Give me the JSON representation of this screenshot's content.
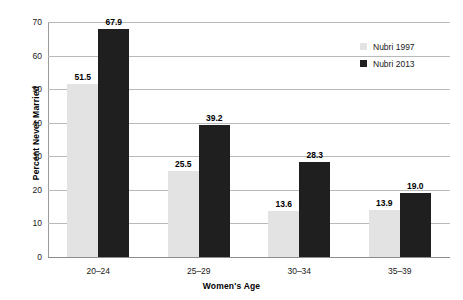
{
  "chart_data": {
    "type": "bar",
    "title": "",
    "xlabel": "Women's Age",
    "ylabel": "Percent Never Married",
    "categories": [
      "20–24",
      "25–29",
      "30–34",
      "35–39"
    ],
    "series": [
      {
        "name": "Nubri 1997",
        "color": "#e3e3e3",
        "values": [
          51.5,
          25.5,
          13.6,
          13.9
        ]
      },
      {
        "name": "Nubri 2013",
        "color": "#1f1f1f",
        "values": [
          67.9,
          39.2,
          28.3,
          19.0
        ]
      }
    ],
    "value_labels": [
      [
        "51.5",
        "25.5",
        "13.6",
        "13.9"
      ],
      [
        "67.9",
        "39.2",
        "28.3",
        "19.0"
      ]
    ],
    "ylim": [
      0,
      70
    ],
    "yticks": [
      0,
      10,
      20,
      30,
      40,
      50,
      60,
      70
    ],
    "ytick_labels": [
      "0",
      "10",
      "20",
      "30",
      "40",
      "50",
      "60",
      "70"
    ],
    "grid": true,
    "legend_position": "top-right"
  },
  "legend": {
    "items": [
      {
        "label": "Nubri 1997",
        "color": "#e3e3e3"
      },
      {
        "label": "Nubri 2013",
        "color": "#1f1f1f"
      }
    ]
  },
  "axes": {
    "y_title": "Percent Never Married",
    "x_title": "Women's Age"
  }
}
